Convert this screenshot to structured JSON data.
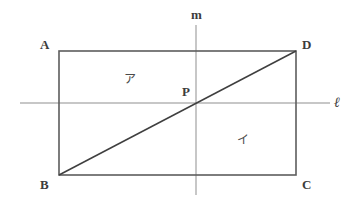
{
  "figure": {
    "type": "geometry-diagram",
    "background_color": "#ffffff",
    "width": 361,
    "height": 203,
    "shape": "rectangle-with-diagonal-and-axes"
  },
  "colors": {
    "rectangle_stroke": "#5d5d5d",
    "diagonal_stroke": "#3f3f3f",
    "axis_stroke": "#8f8f8f",
    "label_text": "#3c3c3c",
    "region_text": "#4a4a4a"
  },
  "vertices": {
    "a": {
      "label": "A",
      "x": 59,
      "y": 51
    },
    "b": {
      "label": "B",
      "x": 59,
      "y": 175
    },
    "c": {
      "label": "C",
      "x": 296,
      "y": 175
    },
    "d": {
      "label": "D",
      "x": 296,
      "y": 51
    }
  },
  "points": {
    "p": {
      "label": "P",
      "x": 196,
      "y": 103
    }
  },
  "lines": {
    "horizontal": {
      "label": "ℓ",
      "name": "line-l",
      "y": 103,
      "x_start": 20,
      "x_end": 330
    },
    "vertical": {
      "label": "m",
      "name": "line-m",
      "x": 196,
      "y_start": 25,
      "y_end": 195
    },
    "diagonal": {
      "name": "diagonal-bd",
      "from": "B",
      "to": "D"
    }
  },
  "regions": {
    "upper": {
      "label": "ア",
      "x": 130,
      "y": 80
    },
    "lower": {
      "label": "イ",
      "x": 243,
      "y": 141
    }
  }
}
